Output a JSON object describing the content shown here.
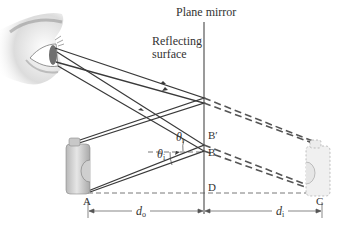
{
  "labels": {
    "plane_mirror": "Plane mirror",
    "reflecting_surface_line1": "Reflecting",
    "reflecting_surface_line2": "surface",
    "point_b_prime": "B′",
    "point_b": "B",
    "point_d": "D",
    "point_a": "A",
    "point_c": "C",
    "theta": "θ",
    "theta_r_sub": "r",
    "theta_i_sub": "i",
    "d": "d",
    "d_o_sub": "o",
    "d_i_sub": "i"
  },
  "colors": {
    "ray": "#3a3a3a",
    "mirror": "#9a9a9a",
    "dash": "#555555",
    "bottle_fill": "#d6d6d6",
    "bottle_image_fill": "#eeeeee",
    "text": "#333333"
  },
  "geometry": {
    "mirror_x": 204,
    "eye": [
      52,
      55
    ],
    "object_top": [
      74,
      143
    ],
    "object_base_A": [
      88,
      192
    ],
    "image_top": [
      315,
      143
    ],
    "image_base_C": [
      322,
      192
    ],
    "reflect_top": [
      204,
      100
    ],
    "reflect_B_prime": [
      204,
      140
    ],
    "reflect_B": [
      204,
      150
    ],
    "point_D": [
      204,
      193
    ]
  }
}
